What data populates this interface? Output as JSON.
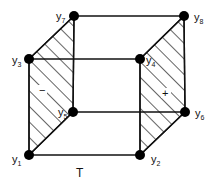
{
  "diagram": {
    "type": "cube-design",
    "colors": {
      "line": "#111111",
      "vertex": "#000000",
      "background": "#ffffff"
    },
    "vertices": [
      {
        "id": "y1",
        "base": "y",
        "sub": "1",
        "x": 29,
        "y": 155
      },
      {
        "id": "y2",
        "base": "y",
        "sub": "2",
        "x": 140,
        "y": 155
      },
      {
        "id": "y3",
        "base": "y",
        "sub": "3",
        "x": 29,
        "y": 59
      },
      {
        "id": "y4",
        "base": "y",
        "sub": "4",
        "x": 140,
        "y": 59
      },
      {
        "id": "y5",
        "base": "y",
        "sub": "5",
        "x": 73,
        "y": 112
      },
      {
        "id": "y6",
        "base": "y",
        "sub": "6",
        "x": 185,
        "y": 112
      },
      {
        "id": "y7",
        "base": "y",
        "sub": "7",
        "x": 74,
        "y": 16
      },
      {
        "id": "y8",
        "base": "y",
        "sub": "8",
        "x": 184,
        "y": 16
      }
    ],
    "faces": {
      "left": {
        "sign": "−",
        "hatched": true
      },
      "right": {
        "sign": "+",
        "hatched": true
      }
    },
    "axis_label": "T"
  }
}
